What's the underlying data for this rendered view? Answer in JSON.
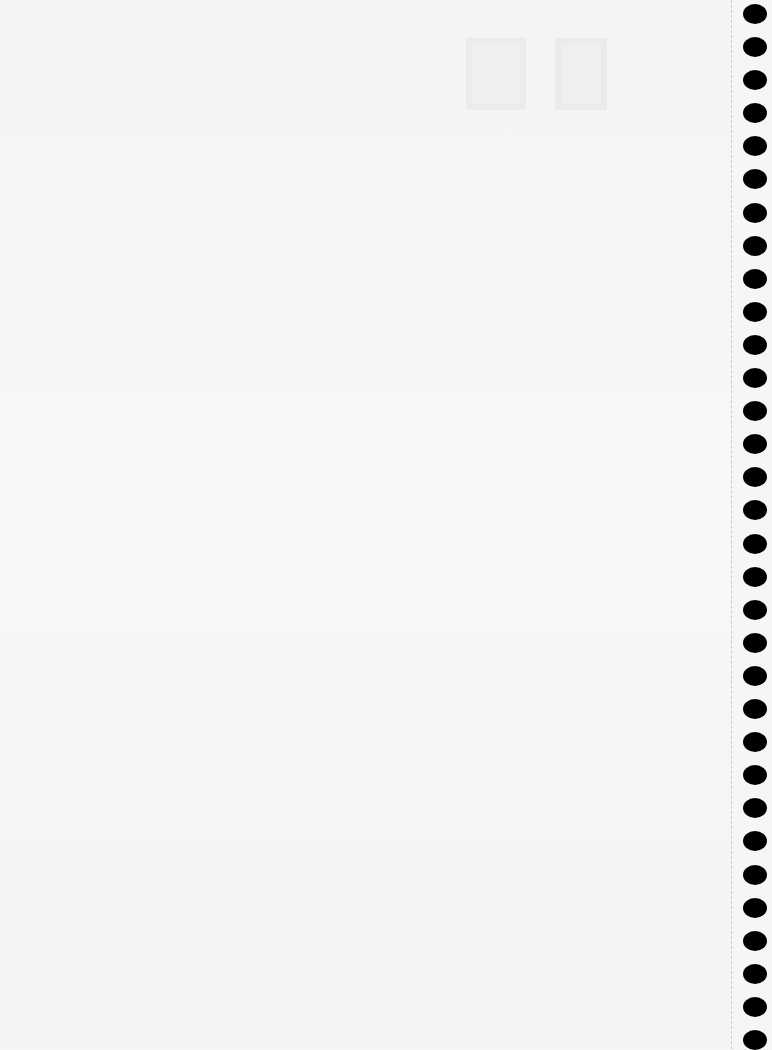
{
  "page": {
    "type": "spiral-notebook-page",
    "background_color": "#f6f6f5",
    "bleed_through": {
      "line1": "—",
      "line2": "—"
    }
  },
  "binding": {
    "hole_count": 32,
    "hole_color": "#000000",
    "perforation_color": "#c9c9c9"
  }
}
